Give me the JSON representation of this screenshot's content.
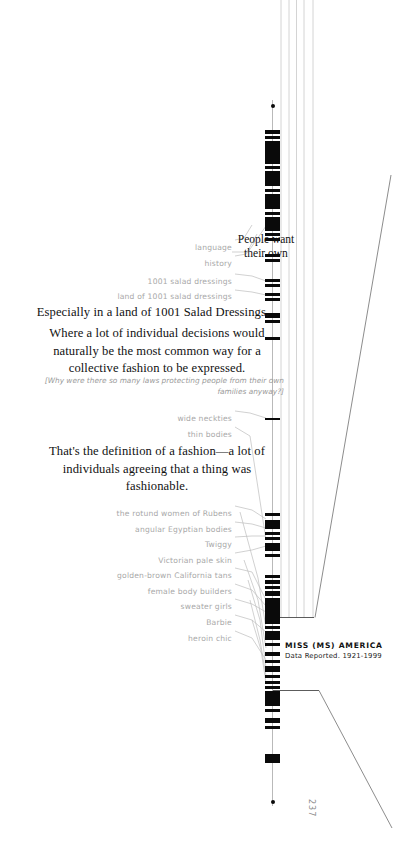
{
  "page": {
    "folio": "237",
    "width": 413,
    "height": 846,
    "background": "#ffffff",
    "ink": "#0a0a0a",
    "rule_color": "#c9c9c9",
    "label_color": "#a8a8a8"
  },
  "series_caption": {
    "title": "MISS (MS) AMERICA",
    "subtitle": "Data Reported. 1921-1999"
  },
  "callouts": [
    {
      "id": "people-want",
      "lines": [
        "People want",
        "their own"
      ]
    }
  ],
  "body_paragraphs": [
    {
      "id": "salad-dressings",
      "align": "center",
      "lines": [
        "Especially in a land of 1001 Salad Dressings."
      ]
    },
    {
      "id": "collective-fashion",
      "align": "center",
      "lines": [
        "Where a lot of individual decisions would",
        "naturally be the most common way for a",
        "collective fashion to be expressed."
      ]
    },
    {
      "id": "definition-of-fashion",
      "align": "center",
      "lines": [
        "That's the definition of a fashion—a lot of",
        "individuals agreeing that a thing was",
        "fashionable."
      ]
    }
  ],
  "aside": {
    "id": "laws-aside",
    "lines": [
      "[Why were there so many laws protecting people from their own",
      "families anyway?]"
    ]
  },
  "tick_labels": [
    {
      "id": "language",
      "text": "language",
      "y": 243,
      "right": 232,
      "anchor_y": 240
    },
    {
      "id": "history",
      "text": "history",
      "y": 259,
      "right": 232,
      "anchor_y": 249
    },
    {
      "id": "salad-dressings-1001",
      "text": "1001 salad dressings",
      "y": 277,
      "right": 232,
      "anchor_y": 281
    },
    {
      "id": "land-of-1001",
      "text": "land of 1001 salad dressings",
      "y": 292,
      "right": 232,
      "anchor_y": 295
    },
    {
      "id": "wide-neckties",
      "text": "wide neckties",
      "y": 414,
      "right": 232,
      "anchor_y": 418
    },
    {
      "id": "thin-bodies",
      "text": "thin bodies",
      "y": 430,
      "right": 232,
      "anchor_y": 420
    },
    {
      "id": "rotund-rubens",
      "text": "the rotund women of Rubens",
      "y": 509,
      "right": 232,
      "anchor_y": 519
    },
    {
      "id": "angular-egyptian",
      "text": "angular Egyptian bodies",
      "y": 525,
      "right": 232,
      "anchor_y": 528
    },
    {
      "id": "twiggy",
      "text": "Twiggy",
      "y": 540,
      "right": 232,
      "anchor_y": 536
    },
    {
      "id": "victorian-pale",
      "text": "Victorian pale skin",
      "y": 556,
      "right": 232,
      "anchor_y": 546
    },
    {
      "id": "california-tans",
      "text": "golden-brown California tans",
      "y": 571,
      "right": 232,
      "anchor_y": 575
    },
    {
      "id": "female-body-builders",
      "text": "female body builders",
      "y": 587,
      "right": 232,
      "anchor_y": 586
    },
    {
      "id": "sweater-girls",
      "text": "sweater girls",
      "y": 602,
      "right": 232,
      "anchor_y": 600
    },
    {
      "id": "barbie",
      "text": "Barbie",
      "y": 618,
      "right": 232,
      "anchor_y": 616
    },
    {
      "id": "heroin-chic",
      "text": "heroin chic",
      "y": 634,
      "right": 232,
      "anchor_y": 630
    }
  ],
  "chart_data": {
    "type": "bar",
    "title": "MISS (MS) AMERICA",
    "subtitle": "Data Reported. 1921-1999",
    "orientation": "vertical-strip",
    "xlabel": "",
    "ylabel": "",
    "grid": false,
    "legend": null,
    "axis_range_px": [
      100,
      806
    ],
    "endpoint_dots": [
      {
        "y": 104
      },
      {
        "y": 800
      }
    ],
    "bands": [
      {
        "y": 130,
        "h": 4
      },
      {
        "y": 136,
        "h": 3
      },
      {
        "y": 141,
        "h": 23
      },
      {
        "y": 166,
        "h": 3
      },
      {
        "y": 171,
        "h": 15
      },
      {
        "y": 189,
        "h": 3
      },
      {
        "y": 194,
        "h": 15
      },
      {
        "y": 212,
        "h": 3
      },
      {
        "y": 217,
        "h": 14
      },
      {
        "y": 233,
        "h": 3
      },
      {
        "y": 238,
        "h": 3
      },
      {
        "y": 254,
        "h": 3
      },
      {
        "y": 259,
        "h": 3
      },
      {
        "y": 279,
        "h": 3
      },
      {
        "y": 284,
        "h": 3
      },
      {
        "y": 293,
        "h": 3
      },
      {
        "y": 298,
        "h": 3
      },
      {
        "y": 313,
        "h": 5
      },
      {
        "y": 320,
        "h": 3
      },
      {
        "y": 337,
        "h": 3
      },
      {
        "y": 418,
        "h": 2
      },
      {
        "y": 513,
        "h": 3
      },
      {
        "y": 520,
        "h": 9
      },
      {
        "y": 532,
        "h": 3
      },
      {
        "y": 537,
        "h": 3
      },
      {
        "y": 543,
        "h": 8
      },
      {
        "y": 554,
        "h": 3
      },
      {
        "y": 575,
        "h": 3
      },
      {
        "y": 580,
        "h": 4
      },
      {
        "y": 586,
        "h": 3
      },
      {
        "y": 591,
        "h": 5
      },
      {
        "y": 598,
        "h": 26
      },
      {
        "y": 626,
        "h": 3
      },
      {
        "y": 631,
        "h": 9
      },
      {
        "y": 643,
        "h": 3
      },
      {
        "y": 652,
        "h": 4
      },
      {
        "y": 660,
        "h": 3
      },
      {
        "y": 666,
        "h": 6
      },
      {
        "y": 675,
        "h": 3
      },
      {
        "y": 681,
        "h": 3
      },
      {
        "y": 686,
        "h": 3
      },
      {
        "y": 691,
        "h": 15
      },
      {
        "y": 709,
        "h": 3
      },
      {
        "y": 718,
        "h": 5
      },
      {
        "y": 726,
        "h": 3
      },
      {
        "y": 754,
        "h": 9
      }
    ]
  },
  "rules": {
    "vertical_lines_x": [
      281,
      289,
      296,
      304,
      313
    ],
    "vertical_lines_top": 0,
    "vertical_lines_bottom": 618,
    "bracket_top_y": 617,
    "bracket_left_x": 272,
    "bracket_right_x": 315,
    "lower_bracket_y": 690,
    "lower_bracket_left_x": 272,
    "lower_bracket_right_x": 320,
    "diagonal_upper": {
      "x1": 391,
      "y1": 175,
      "x2": 316,
      "y2": 618
    },
    "diagonal_lower": {
      "x1": 320,
      "y1": 690,
      "x2": 392,
      "y2": 828
    }
  }
}
